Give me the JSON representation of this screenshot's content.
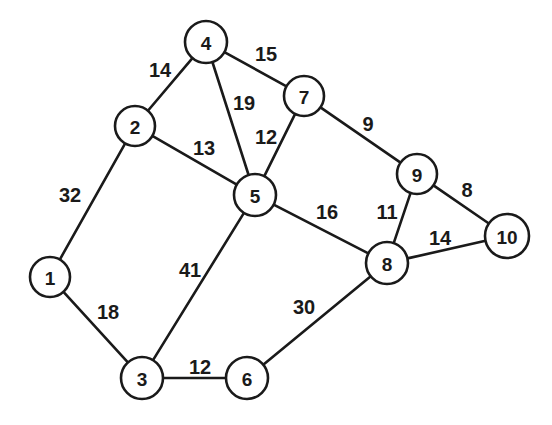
{
  "figure": {
    "background_color": "#ffffff",
    "stroke_color": "#1a1a1a",
    "node_fill_color": "#ffffff",
    "width": 552,
    "height": 425
  },
  "chart_data": {
    "type": "diagram",
    "diagram_kind": "undirected-weighted-graph",
    "title": "",
    "xlabel": "",
    "ylabel": "",
    "grid": false,
    "legend": "none",
    "node_count": 10,
    "edge_count": 16,
    "nodes": [
      {
        "id": "1",
        "label": "1",
        "x": 50,
        "y": 277,
        "r": 20
      },
      {
        "id": "2",
        "label": "2",
        "x": 135,
        "y": 126,
        "r": 20
      },
      {
        "id": "3",
        "label": "3",
        "x": 142,
        "y": 378,
        "r": 21
      },
      {
        "id": "4",
        "label": "4",
        "x": 206,
        "y": 42,
        "r": 21
      },
      {
        "id": "5",
        "label": "5",
        "x": 255,
        "y": 195,
        "r": 21
      },
      {
        "id": "6",
        "label": "6",
        "x": 247,
        "y": 378,
        "r": 21
      },
      {
        "id": "7",
        "label": "7",
        "x": 304,
        "y": 96,
        "r": 20
      },
      {
        "id": "8",
        "label": "8",
        "x": 387,
        "y": 263,
        "r": 21
      },
      {
        "id": "9",
        "label": "9",
        "x": 417,
        "y": 174,
        "r": 20
      },
      {
        "id": "10",
        "label": "10",
        "x": 507,
        "y": 236,
        "r": 22
      }
    ],
    "edges": [
      {
        "source": "1",
        "target": "2",
        "weight": 32,
        "label": "32",
        "label_x": 70,
        "label_y": 195
      },
      {
        "source": "1",
        "target": "3",
        "weight": 18,
        "label": "18",
        "label_x": 108,
        "label_y": 312
      },
      {
        "source": "2",
        "target": "4",
        "weight": 14,
        "label": "14",
        "label_x": 160,
        "label_y": 70
      },
      {
        "source": "2",
        "target": "5",
        "weight": 13,
        "label": "13",
        "label_x": 204,
        "label_y": 148
      },
      {
        "source": "3",
        "target": "5",
        "weight": 41,
        "label": "41",
        "label_x": 190,
        "label_y": 270
      },
      {
        "source": "3",
        "target": "6",
        "weight": 12,
        "label": "12",
        "label_x": 200,
        "label_y": 367
      },
      {
        "source": "4",
        "target": "5",
        "weight": 19,
        "label": "19",
        "label_x": 244,
        "label_y": 103
      },
      {
        "source": "4",
        "target": "7",
        "weight": 15,
        "label": "15",
        "label_x": 266,
        "label_y": 54
      },
      {
        "source": "5",
        "target": "7",
        "weight": 12,
        "label": "12",
        "label_x": 266,
        "label_y": 137
      },
      {
        "source": "5",
        "target": "8",
        "weight": 16,
        "label": "16",
        "label_x": 327,
        "label_y": 212
      },
      {
        "source": "6",
        "target": "8",
        "weight": 30,
        "label": "30",
        "label_x": 304,
        "label_y": 307
      },
      {
        "source": "7",
        "target": "9",
        "weight": 9,
        "label": "9",
        "label_x": 368,
        "label_y": 124
      },
      {
        "source": "8",
        "target": "9",
        "weight": 11,
        "label": "11",
        "label_x": 387,
        "label_y": 212
      },
      {
        "source": "8",
        "target": "10",
        "weight": 14,
        "label": "14",
        "label_x": 440,
        "label_y": 238
      },
      {
        "source": "9",
        "target": "10",
        "weight": 8,
        "label": "8",
        "label_x": 467,
        "label_y": 190
      }
    ]
  }
}
